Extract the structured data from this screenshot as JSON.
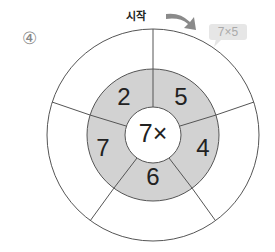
{
  "problem_number": "④",
  "start_label": "시작",
  "example_bubble": "7×5",
  "center_label": "7×",
  "ring_numbers": [
    "2",
    "5",
    "4",
    "6",
    "7"
  ],
  "colors": {
    "ring_fill": "#d2d2d2",
    "line": "#555555",
    "arrow": "#8a8a8a"
  }
}
